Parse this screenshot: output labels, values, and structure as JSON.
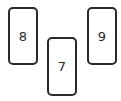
{
  "cards": [
    {
      "label": "8",
      "x": 8,
      "y": 7,
      "w": 30,
      "h": 58
    },
    {
      "label": "7",
      "x": 47,
      "y": 37,
      "w": 30,
      "h": 59
    },
    {
      "label": "9",
      "x": 87,
      "y": 7,
      "w": 30,
      "h": 58
    }
  ]
}
